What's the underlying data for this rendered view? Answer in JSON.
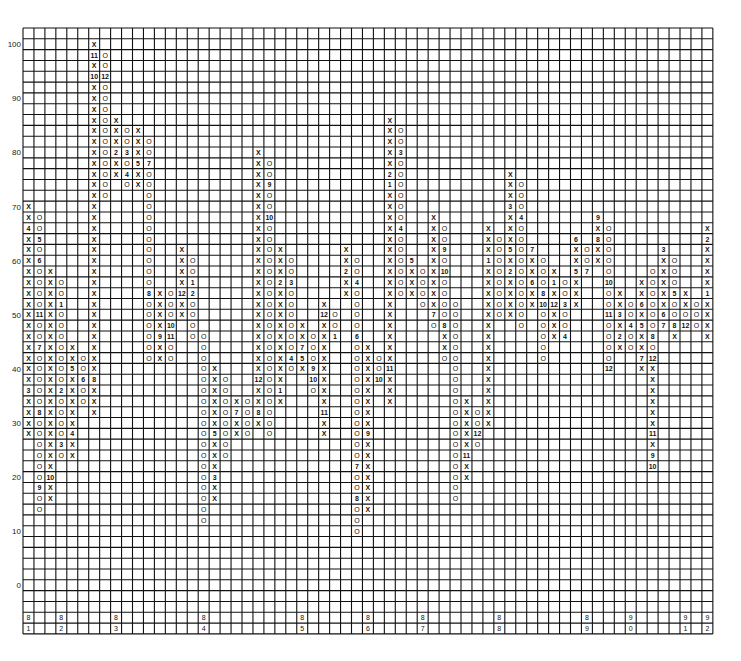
{
  "chart_data": {
    "type": "point-and-figure",
    "title": "",
    "xlabel": "",
    "ylabel": "",
    "box_size": 2,
    "y_range": [
      -6,
      102
    ],
    "y_ticks": [
      0,
      10,
      20,
      30,
      40,
      50,
      60,
      70,
      80,
      90,
      100
    ],
    "grid": true,
    "legend": "none",
    "columns": [
      {
        "top": 70,
        "cells": [
          "X",
          "X",
          "4",
          "X",
          "X",
          "X",
          "X",
          "X",
          "X",
          "X",
          "X",
          "X",
          "X",
          "X",
          "X",
          "X",
          "X",
          "3",
          "X",
          "X",
          "X",
          "X"
        ]
      },
      {
        "top": 68,
        "cells": [
          "O",
          "O",
          "5",
          "O",
          "6",
          "O",
          "O",
          "O",
          "O",
          "11",
          "O",
          "O",
          "7",
          "O",
          "O",
          "O",
          "O",
          "O",
          "8",
          "O",
          "O",
          "O",
          "O",
          "O",
          "O",
          "9",
          "O",
          "O"
        ]
      },
      {
        "top": 58,
        "cells": [
          "X",
          "X",
          "X",
          "X",
          "X",
          "X",
          "X",
          "X",
          "X",
          "X",
          "X",
          "X",
          "X",
          "X",
          "X",
          "X",
          "X",
          "X",
          "X",
          "10",
          "X",
          "X"
        ]
      },
      {
        "top": 56,
        "cells": [
          "O",
          "O",
          "1",
          "O",
          "O",
          "O",
          "O",
          "O",
          "O",
          "O",
          "2",
          "O",
          "O",
          "O",
          "O",
          "3",
          "O"
        ]
      },
      {
        "top": 44,
        "cells": [
          "X",
          "X",
          "5",
          "X",
          "X",
          "X",
          "X",
          "X",
          "4",
          "X",
          "X"
        ]
      },
      {
        "top": 42,
        "cells": [
          "O",
          "O",
          "6",
          "O",
          "O"
        ]
      },
      {
        "top": 100,
        "cells": [
          "X",
          "11",
          "X",
          "10",
          "X",
          "X",
          "X",
          "X",
          "X",
          "X",
          "X",
          "X",
          "X",
          "X",
          "X",
          "X",
          "X",
          "X",
          "X",
          "X",
          "X",
          "X",
          "X",
          "X",
          "X",
          "X",
          "X",
          "X",
          "X",
          "X",
          "X",
          "8",
          "X",
          "X",
          "X"
        ]
      },
      {
        "top": 98,
        "cells": [
          "O",
          "O",
          "12",
          "O",
          "O",
          "O",
          "O",
          "O",
          "O",
          "O",
          "O",
          "O",
          "O",
          "O"
        ]
      },
      {
        "top": 86,
        "cells": [
          "X",
          "X",
          "X",
          "2",
          "X",
          "X"
        ]
      },
      {
        "top": 84,
        "cells": [
          "O",
          "O",
          "3",
          "O",
          "4",
          "O"
        ]
      },
      {
        "top": 84,
        "cells": [
          "X",
          "X",
          "X",
          "5",
          "X",
          "X"
        ]
      },
      {
        "top": 82,
        "cells": [
          "O",
          "O",
          "7",
          "O",
          "O",
          "O",
          "O",
          "O",
          "O",
          "O",
          "O",
          "O",
          "O",
          "O",
          "8",
          "O",
          "O",
          "O",
          "O",
          "O",
          "O"
        ]
      },
      {
        "top": 54,
        "cells": [
          "X",
          "X",
          "X",
          "X",
          "9",
          "X",
          "X"
        ]
      },
      {
        "top": 54,
        "cells": [
          "O",
          "O",
          "O",
          "10",
          "11",
          "O",
          "O"
        ]
      },
      {
        "top": 62,
        "cells": [
          "X",
          "X",
          "X",
          "X",
          "12",
          "X",
          "X"
        ]
      },
      {
        "top": 60,
        "cells": [
          "O",
          "O",
          "1",
          "2",
          "O",
          "O",
          "O",
          "O"
        ]
      },
      {
        "top": 46,
        "cells": [
          "O",
          "O",
          "O",
          "O",
          "O",
          "O",
          "O",
          "O",
          "O",
          "O",
          "O",
          "O",
          "O",
          "O",
          "O",
          "O",
          "O",
          "O"
        ]
      },
      {
        "top": 40,
        "cells": [
          "X",
          "X",
          "X",
          "X",
          "X",
          "X",
          "5",
          "X",
          "X",
          "X",
          "3",
          "X",
          "X"
        ]
      },
      {
        "top": 38,
        "cells": [
          "O",
          "O",
          "O",
          "O",
          "O",
          "O",
          "O",
          "O"
        ]
      },
      {
        "top": 34,
        "cells": [
          "X",
          "7",
          "X",
          "X"
        ]
      },
      {
        "top": 34,
        "cells": [
          "O",
          "O",
          "O",
          "O"
        ]
      },
      {
        "top": 80,
        "cells": [
          "X",
          "X",
          "X",
          "X",
          "X",
          "X",
          "X",
          "X",
          "X",
          "X",
          "X",
          "X",
          "X",
          "X",
          "X",
          "X",
          "X",
          "X",
          "X",
          "X",
          "X",
          "12",
          "X",
          "X",
          "8",
          "X"
        ]
      },
      {
        "top": 78,
        "cells": [
          "O",
          "O",
          "9",
          "O",
          "O",
          "10",
          "O",
          "O",
          "O",
          "O",
          "O",
          "O",
          "O",
          "O",
          "O",
          "O",
          "O",
          "O",
          "O",
          "O",
          "O",
          "O",
          "O",
          "O",
          "O",
          "O"
        ]
      },
      {
        "top": 62,
        "cells": [
          "X",
          "X",
          "X",
          "2",
          "X",
          "X",
          "X",
          "X",
          "X",
          "X",
          "X",
          "X",
          "X",
          "1",
          "X"
        ]
      },
      {
        "top": 60,
        "cells": [
          "O",
          "O",
          "3",
          "O",
          "O",
          "O",
          "O",
          "O",
          "O",
          "4",
          "O"
        ]
      },
      {
        "top": 48,
        "cells": [
          "X",
          "X",
          "7",
          "5",
          "X"
        ]
      },
      {
        "top": 46,
        "cells": [
          "O",
          "O",
          "O",
          "9",
          "10",
          "O"
        ]
      },
      {
        "top": 52,
        "cells": [
          "X",
          "12",
          "X",
          "X",
          "X",
          "X",
          "X",
          "X",
          "X",
          "X",
          "11",
          "X",
          "X"
        ]
      },
      {
        "top": 50,
        "cells": [
          "O",
          "O",
          "1"
        ]
      },
      {
        "top": 62,
        "cells": [
          "X",
          "X",
          "2",
          "X",
          "X"
        ]
      },
      {
        "top": 60,
        "cells": [
          "O",
          "O",
          "4",
          "O",
          "O",
          "O",
          "O",
          "6",
          "O",
          "O",
          "O",
          "O",
          "O",
          "O",
          "O",
          "O",
          "O",
          "O",
          "O",
          "7",
          "O",
          "O",
          "8",
          "O",
          "O",
          "O"
        ]
      },
      {
        "top": 44,
        "cells": [
          "X",
          "X",
          "X",
          "X",
          "X",
          "X",
          "X",
          "X",
          "9",
          "X",
          "X",
          "X",
          "X",
          "X",
          "X",
          "X"
        ]
      },
      {
        "top": 42,
        "cells": [
          "O",
          "O",
          "10"
        ]
      },
      {
        "top": 86,
        "cells": [
          "X",
          "X",
          "X",
          "X",
          "X",
          "2",
          "1",
          "X",
          "X",
          "X",
          "X",
          "X",
          "X",
          "X",
          "X",
          "X",
          "X",
          "X",
          "X",
          "X",
          "X",
          "X",
          "X",
          "11",
          "X",
          "X",
          "X"
        ]
      },
      {
        "top": 84,
        "cells": [
          "O",
          "O",
          "3",
          "O",
          "O",
          "O",
          "O",
          "O",
          "O",
          "4",
          "O",
          "O",
          "O",
          "O",
          "O",
          "O"
        ]
      },
      {
        "top": 60,
        "cells": [
          "5",
          "X",
          "X",
          "X"
        ]
      },
      {
        "top": 58,
        "cells": [
          "O",
          "O",
          "O",
          "O"
        ]
      },
      {
        "top": 68,
        "cells": [
          "X",
          "X",
          "X",
          "X",
          "X",
          "X",
          "X",
          "X",
          "X",
          "7",
          "O"
        ]
      },
      {
        "top": 66,
        "cells": [
          "O",
          "O",
          "9",
          "O",
          "10",
          "O",
          "O",
          "O",
          "O",
          "8",
          "X",
          "X",
          "O"
        ]
      },
      {
        "top": 52,
        "cells": [
          "O",
          "O",
          "O",
          "O",
          "O",
          "O",
          "O",
          "O",
          "O",
          "O",
          "O",
          "O",
          "O",
          "O",
          "O",
          "O",
          "O",
          "O",
          "O"
        ]
      },
      {
        "top": 34,
        "cells": [
          "X",
          "X",
          "X",
          "X",
          "X",
          "11",
          "X",
          "X"
        ]
      },
      {
        "top": 32,
        "cells": [
          "O",
          "O",
          "12",
          "O"
        ]
      },
      {
        "top": 66,
        "cells": [
          "X",
          "X",
          "X",
          "1",
          "X",
          "X",
          "X",
          "X",
          "X",
          "X",
          "X",
          "X",
          "X",
          "X",
          "X",
          "X",
          "X",
          "X",
          "X"
        ]
      },
      {
        "top": 64,
        "cells": [
          "O",
          "O",
          "O",
          "O",
          "O",
          "O",
          "O",
          "O"
        ]
      },
      {
        "top": 76,
        "cells": [
          "X",
          "X",
          "X",
          "3",
          "X",
          "X",
          "X",
          "5",
          "X",
          "2",
          "X",
          "X",
          "X",
          "X"
        ]
      },
      {
        "top": 74,
        "cells": [
          "O",
          "O",
          "O",
          "4",
          "O",
          "O",
          "O",
          "O",
          "O",
          "O",
          "O",
          "O",
          "O",
          "O"
        ]
      },
      {
        "top": 62,
        "cells": [
          "7",
          "X",
          "X",
          "6",
          "X",
          "X"
        ]
      },
      {
        "top": 60,
        "cells": [
          "O",
          "O",
          "O",
          "8",
          "10",
          "O",
          "O",
          "O",
          "O",
          "O"
        ]
      },
      {
        "top": 58,
        "cells": [
          "X",
          "1",
          "X",
          "12",
          "X",
          "X",
          "X"
        ]
      },
      {
        "top": 56,
        "cells": [
          "O",
          "O",
          "3",
          "O",
          "O",
          "4"
        ]
      },
      {
        "top": 64,
        "cells": [
          "6",
          "X",
          "X",
          "5",
          "X",
          "X",
          "X"
        ]
      },
      {
        "top": 62,
        "cells": [
          "O",
          "O",
          "7"
        ]
      },
      {
        "top": 68,
        "cells": [
          "9",
          "X",
          "8",
          "X",
          "X"
        ]
      },
      {
        "top": 66,
        "cells": [
          "O",
          "O",
          "O",
          "O",
          "O",
          "10",
          "O",
          "O",
          "11",
          "O",
          "O",
          "O",
          "O",
          "12"
        ]
      },
      {
        "top": 54,
        "cells": [
          "X",
          "X",
          "3",
          "X",
          "2",
          "X"
        ]
      },
      {
        "top": 52,
        "cells": [
          "O",
          "O",
          "4",
          "O",
          "O"
        ]
      },
      {
        "top": 56,
        "cells": [
          "X",
          "X",
          "6",
          "X",
          "5",
          "X",
          "X",
          "7",
          "X"
        ]
      },
      {
        "top": 58,
        "cells": [
          "O",
          "O",
          "O",
          "O",
          "O",
          "O",
          "8",
          "O",
          "12",
          "X",
          "X",
          "X",
          "X",
          "X",
          "X",
          "11",
          "X",
          "9",
          "10"
        ]
      },
      {
        "top": 62,
        "cells": [
          "3",
          "X",
          "X",
          "X",
          "X",
          "X",
          "6",
          "7"
        ]
      },
      {
        "top": 60,
        "cells": [
          "O",
          "O",
          "O",
          "5",
          "O",
          "O",
          "8",
          "X"
        ]
      },
      {
        "top": 54,
        "cells": [
          "X",
          "X",
          "O",
          "12"
        ]
      },
      {
        "top": 52,
        "cells": [
          "O",
          "O",
          "O"
        ]
      },
      {
        "top": 66,
        "cells": [
          "X",
          "2",
          "X",
          "X",
          "X",
          "X",
          "1",
          "X",
          "X",
          "X",
          "X"
        ]
      },
      {
        "top": 64,
        "cells": [
          "O",
          "O",
          "3",
          "O",
          "4",
          "O",
          "O",
          "O",
          "O",
          "O"
        ]
      }
    ],
    "x_year_labels": [
      {
        "col": 0,
        "top": "8",
        "bottom": "1"
      },
      {
        "col": 3,
        "top": "8",
        "bottom": "2"
      },
      {
        "col": 8,
        "top": "8",
        "bottom": "3"
      },
      {
        "col": 16,
        "top": "8",
        "bottom": "4"
      },
      {
        "col": 25,
        "top": "8",
        "bottom": "5"
      },
      {
        "col": 31,
        "top": "8",
        "bottom": "6"
      },
      {
        "col": 36,
        "top": "8",
        "bottom": "7"
      },
      {
        "col": 43,
        "top": "8",
        "bottom": "8"
      },
      {
        "col": 51,
        "top": "8",
        "bottom": "9"
      },
      {
        "col": 55,
        "top": "9",
        "bottom": "0"
      },
      {
        "col": 60,
        "top": "9",
        "bottom": "1"
      },
      {
        "col": 64,
        "top": "9",
        "bottom": "2"
      }
    ]
  }
}
